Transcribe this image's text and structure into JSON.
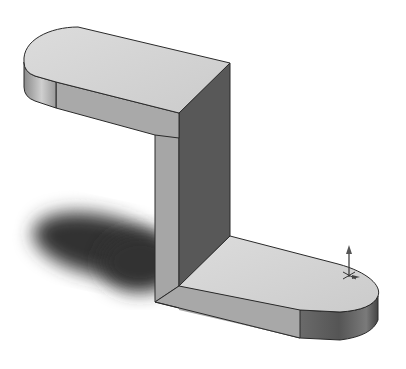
{
  "scene": {
    "description": "Isometric shaded 3D CAD model of a Z-shaped bracket with rounded ends",
    "colors": {
      "background": "#ffffff",
      "top_face": "#d4d4d4",
      "front_face": "#a8a8a8",
      "dark_face": "#5a5a5a",
      "edge": "#2a2a2a",
      "shadow": "#3a3a3a"
    },
    "parts": [
      {
        "name": "top-plate",
        "label": "Top plate with rounded end"
      },
      {
        "name": "vertical-web",
        "label": "Vertical web"
      },
      {
        "name": "bottom-plate",
        "label": "Bottom plate with rounded end"
      }
    ],
    "triad": {
      "name": "origin-triad",
      "label": "Origin axis triad"
    }
  }
}
